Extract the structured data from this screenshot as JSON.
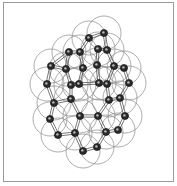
{
  "diagram": {
    "type": "molecular-structure",
    "style": "ball-and-stick with van der Waals spheres",
    "colors": {
      "atom": "#2a2a2a",
      "atom_highlight": "#bdbdbd",
      "bond": "#555555",
      "sphere": "#8a8a8a",
      "frame": "#9a9a9a"
    },
    "sphere_radius": 17,
    "atom_radius": 3.6,
    "atoms": [
      [
        89,
        38
      ],
      [
        104,
        33
      ],
      [
        69,
        52
      ],
      [
        80,
        52
      ],
      [
        98,
        49
      ],
      [
        107,
        50
      ],
      [
        51,
        66
      ],
      [
        66,
        69
      ],
      [
        83,
        68
      ],
      [
        97,
        65
      ],
      [
        114,
        66
      ],
      [
        124,
        68
      ],
      [
        47,
        84
      ],
      [
        71,
        85
      ],
      [
        79,
        84
      ],
      [
        99,
        83
      ],
      [
        107,
        84
      ],
      [
        129,
        83
      ],
      [
        54,
        103
      ],
      [
        71,
        99
      ],
      [
        109,
        100
      ],
      [
        120,
        98
      ],
      [
        80,
        116
      ],
      [
        98,
        116
      ],
      [
        125,
        116
      ],
      [
        50,
        119
      ],
      [
        58,
        135
      ],
      [
        75,
        133
      ],
      [
        106,
        132
      ],
      [
        118,
        130
      ],
      [
        83,
        151
      ],
      [
        97,
        147
      ]
    ],
    "bonds": [
      [
        0,
        1
      ],
      [
        0,
        3
      ],
      [
        1,
        5
      ],
      [
        4,
        5
      ],
      [
        4,
        9
      ],
      [
        2,
        3
      ],
      [
        2,
        7
      ],
      [
        3,
        8
      ],
      [
        2,
        6
      ],
      [
        6,
        12
      ],
      [
        7,
        13
      ],
      [
        7,
        6
      ],
      [
        8,
        14
      ],
      [
        9,
        15
      ],
      [
        15,
        16
      ],
      [
        5,
        10
      ],
      [
        10,
        11
      ],
      [
        10,
        16
      ],
      [
        11,
        17
      ],
      [
        13,
        14
      ],
      [
        14,
        15
      ],
      [
        12,
        18
      ],
      [
        13,
        19
      ],
      [
        18,
        19
      ],
      [
        16,
        20
      ],
      [
        20,
        21
      ],
      [
        21,
        17
      ],
      [
        18,
        25
      ],
      [
        19,
        22
      ],
      [
        22,
        23
      ],
      [
        23,
        20
      ],
      [
        21,
        24
      ],
      [
        25,
        26
      ],
      [
        26,
        27
      ],
      [
        27,
        22
      ],
      [
        23,
        28
      ],
      [
        28,
        29
      ],
      [
        29,
        24
      ],
      [
        27,
        30
      ],
      [
        30,
        31
      ],
      [
        31,
        28
      ]
    ]
  }
}
